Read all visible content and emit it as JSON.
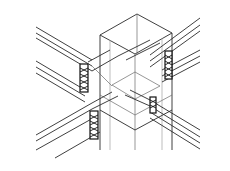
{
  "figure": {
    "components": [
      {
        "id": "column",
        "label": "column"
      },
      {
        "id": "beam-upper-left",
        "label": "beam"
      },
      {
        "id": "beam-upper-right",
        "label": "beam"
      },
      {
        "id": "beam-lower-left",
        "label": "beam"
      },
      {
        "id": "beam-lower-right",
        "label": "beam"
      },
      {
        "id": "plate-upper-left",
        "label": "connection plate"
      },
      {
        "id": "plate-upper-right",
        "label": "connection plate"
      },
      {
        "id": "plate-lower-left",
        "label": "connection plate"
      },
      {
        "id": "plate-lower-right",
        "label": "connection plate"
      }
    ],
    "colors": {
      "line": "#2a2a2a",
      "background": "#ffffff"
    }
  }
}
